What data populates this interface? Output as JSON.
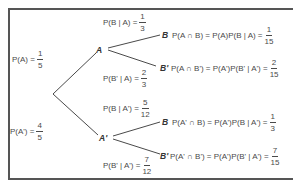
{
  "diagram": {
    "type": "probability-tree",
    "root": {
      "branches": [
        {
          "node": "A",
          "label": {
            "text": "P(A) =",
            "num": "1",
            "den": "5"
          },
          "branches": [
            {
              "node": "B",
              "label": {
                "text": "P(B | A) =",
                "num": "1",
                "den": "3"
              },
              "result": {
                "text": "P(A ∩ B) = P(A)P(B | A) =",
                "num": "1",
                "den": "15"
              }
            },
            {
              "node": "B'",
              "label": {
                "text": "P(B' | A) =",
                "num": "2",
                "den": "3"
              },
              "result": {
                "text": "P(A ∩ B') = P(A')P(B' | A') =",
                "num": "2",
                "den": "15"
              }
            }
          ]
        },
        {
          "node": "A'",
          "label": {
            "text": "P(A') =",
            "num": "4",
            "den": "5"
          },
          "branches": [
            {
              "node": "B",
              "label": {
                "text": "P(B | A') =",
                "num": "5",
                "den": "12"
              },
              "result": {
                "text": "P(A' ∩ B) = P(A')P(B | A') =",
                "num": "1",
                "den": "3"
              }
            },
            {
              "node": "B'",
              "label": {
                "text": "P(B' | A') =",
                "num": "7",
                "den": "12"
              },
              "result": {
                "text": "P(A' ∩ B') = P(A')P(B' | A') =",
                "num": "7",
                "den": "15"
              }
            }
          ]
        }
      ]
    },
    "colors": {
      "line": "#4a4a4a",
      "border": "#555555",
      "text": "#4a4a4a"
    }
  }
}
